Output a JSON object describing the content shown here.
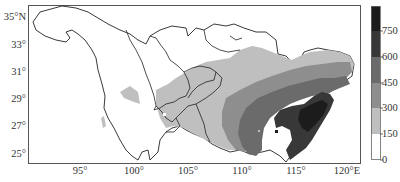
{
  "map": {
    "type": "choropleth",
    "region": "Yangtze River Basin",
    "lon_range": [
      90.5,
      122
    ],
    "lat_range": [
      24.3,
      35.9
    ],
    "y_ticks": [
      {
        "label": "35°N",
        "y": 12
      },
      {
        "label": "33°",
        "y": 40
      },
      {
        "label": "31°",
        "y": 67
      },
      {
        "label": "29°",
        "y": 94
      },
      {
        "label": "27°",
        "y": 121
      },
      {
        "label": "25°",
        "y": 149
      }
    ],
    "x_ticks": [
      {
        "label": "95°",
        "x": 80
      },
      {
        "label": "100°",
        "x": 134
      },
      {
        "label": "105°",
        "x": 188
      },
      {
        "label": "110°",
        "x": 242
      },
      {
        "label": "115°",
        "x": 296
      },
      {
        "label": "120°E",
        "x": 347
      }
    ]
  },
  "colorbar": {
    "ticks": [
      {
        "label": "750",
        "y": 26
      },
      {
        "label": "600",
        "y": 52
      },
      {
        "label": "450",
        "y": 78
      },
      {
        "label": "300",
        "y": 103
      },
      {
        "label": "150",
        "y": 129
      },
      {
        "label": "0",
        "y": 155
      }
    ],
    "bands": [
      {
        "range": "750+",
        "color": "#1c1c1c"
      },
      {
        "range": "600-750",
        "color": "#383838"
      },
      {
        "range": "450-600",
        "color": "#6b6b6b"
      },
      {
        "range": "300-450",
        "color": "#8e8e8e"
      },
      {
        "range": "150-300",
        "color": "#bfbfbf"
      },
      {
        "range": "0-150",
        "color": "#ffffff"
      }
    ]
  }
}
